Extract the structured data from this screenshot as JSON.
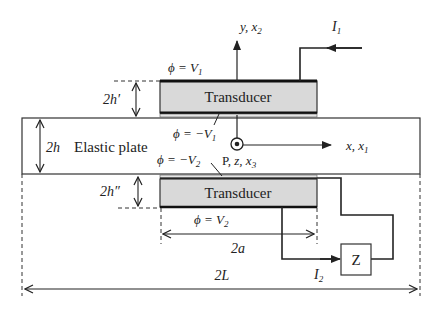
{
  "diagram": {
    "type": "schematic",
    "colors": {
      "line": "#222222",
      "transducer_fill": "#d9d9d9",
      "background": "#ffffff"
    },
    "labels": {
      "top_transducer": "Transducer",
      "bottom_transducer": "Transducer",
      "plate": "Elastic plate",
      "phi_top_outer": "ϕ = V",
      "phi_top_outer_sub": "1",
      "phi_top_inner": "ϕ = −V",
      "phi_top_inner_sub": "1",
      "phi_bottom_inner": "ϕ = −V",
      "phi_bottom_inner_sub": "2",
      "phi_bottom_outer": "ϕ = V",
      "phi_bottom_outer_sub": "2",
      "y_axis": "y, x",
      "y_axis_sub": "2",
      "x_axis": "x, x",
      "x_axis_sub": "1",
      "point_label": "P, ",
      "z_label": "z, x",
      "z_label_sub": "3",
      "current_1": "I",
      "current_1_sub": "1",
      "current_2": "I",
      "current_2_sub": "2",
      "impedance": "Z",
      "dim_top_thickness": "2h′",
      "dim_plate_thickness": "2h",
      "dim_bottom_thickness": "2h″",
      "dim_electrode_width": "2a",
      "dim_plate_length": "2L"
    }
  }
}
